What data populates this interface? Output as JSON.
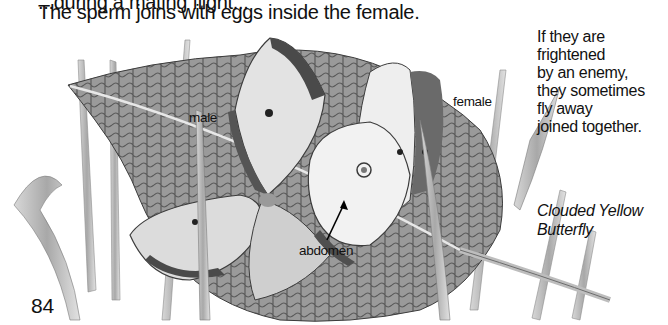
{
  "page": {
    "cut_off_top_line": "...during a mating flight...",
    "intro_text": "The sperm joins with eggs inside the female.",
    "page_number": "84"
  },
  "illustration": {
    "subject": "Two butterflies mating on a leaf among grass blades",
    "labels": {
      "male": "male",
      "female": "female",
      "abdomen": "abdomen"
    }
  },
  "side_note": {
    "lines": [
      "If they are",
      "frightened",
      "by an enemy,",
      "they sometimes",
      "fly away",
      "joined together."
    ]
  },
  "caption": {
    "lines": [
      "Clouded Yellow",
      "Butterfly"
    ]
  },
  "colors": {
    "text": "#111111",
    "background": "#ffffff",
    "leaf_dark": "#4a4a4a",
    "leaf_mid": "#8a8a8a",
    "leaf_light": "#c8c8c8",
    "wing_light": "#e6e6e6",
    "grass": "#b9b9b9"
  }
}
